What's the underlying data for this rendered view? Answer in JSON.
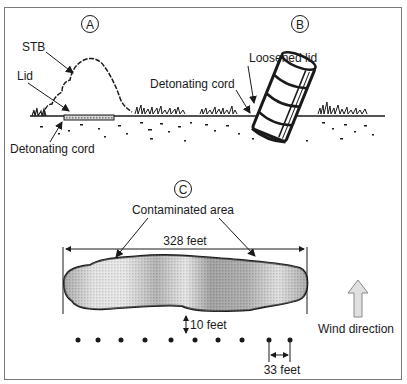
{
  "panels": {
    "a": {
      "marker": "A",
      "labels": {
        "stb": "STB",
        "lid": "Lid",
        "cord": "Detonating cord"
      }
    },
    "b": {
      "marker": "B",
      "labels": {
        "lid": "Loosened lid",
        "cord": "Detonating cord"
      }
    },
    "c": {
      "marker": "C",
      "labels": {
        "area": "Contaminated area",
        "width": "328 feet",
        "offset": "10 feet",
        "spacing": "33 feet",
        "wind": "Wind direction"
      },
      "sampler_count": 10
    }
  },
  "colors": {
    "ink": "#1a1a1a",
    "frame": "#7a7a7a",
    "plume_dark": "#8c8c8c",
    "plume_light": "#e6e6e6",
    "arrow_fill": "#e0e0e0"
  }
}
